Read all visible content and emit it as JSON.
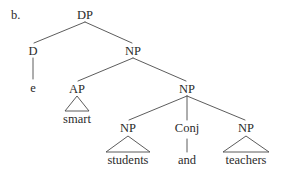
{
  "figure": {
    "item_label": "b.",
    "kind": "syntax-tree",
    "ink_color": "#2b2b2b",
    "line_color": "#4a4a4a",
    "background_color": "#ffffff"
  },
  "nodes": {
    "dp": {
      "label": "DP",
      "x": 85,
      "y": 15
    },
    "d": {
      "label": "D",
      "x": 33,
      "y": 51
    },
    "np_top": {
      "label": "NP",
      "x": 133,
      "y": 51
    },
    "ap": {
      "label": "AP",
      "x": 77,
      "y": 89
    },
    "np_coord": {
      "label": "NP",
      "x": 187,
      "y": 89
    },
    "np_students": {
      "label": "NP",
      "x": 128,
      "y": 128
    },
    "conj": {
      "label": "Conj",
      "x": 187,
      "y": 128
    },
    "np_teachers": {
      "label": "NP",
      "x": 246,
      "y": 128
    }
  },
  "leaves": {
    "e": {
      "label": "e",
      "x": 33,
      "y": 88
    },
    "smart": {
      "label": "smart",
      "x": 77,
      "y": 119
    },
    "students": {
      "label": "students",
      "x": 128,
      "y": 160
    },
    "and": {
      "label": "and",
      "x": 187,
      "y": 160
    },
    "teachers": {
      "label": "teachers",
      "x": 246,
      "y": 160
    }
  },
  "branches": [
    {
      "name": "dp-to-d",
      "x1": 85,
      "y1": 22,
      "x2": 34,
      "y2": 43
    },
    {
      "name": "dp-to-np",
      "x1": 85,
      "y1": 22,
      "x2": 132,
      "y2": 43
    },
    {
      "name": "d-to-e",
      "x1": 33,
      "y1": 58,
      "x2": 33,
      "y2": 79
    },
    {
      "name": "np-to-ap",
      "x1": 133,
      "y1": 58,
      "x2": 78,
      "y2": 81
    },
    {
      "name": "np-to-np-coord",
      "x1": 133,
      "y1": 58,
      "x2": 186,
      "y2": 81
    },
    {
      "name": "np-coord-to-np-students",
      "x1": 187,
      "y1": 96,
      "x2": 129,
      "y2": 120
    },
    {
      "name": "np-coord-to-conj",
      "x1": 187,
      "y1": 96,
      "x2": 187,
      "y2": 120
    },
    {
      "name": "np-coord-to-np-teachers",
      "x1": 187,
      "y1": 96,
      "x2": 245,
      "y2": 120
    },
    {
      "name": "conj-to-and",
      "x1": 187,
      "y1": 139,
      "x2": 187,
      "y2": 152
    }
  ],
  "triangles": [
    {
      "name": "ap-triangle",
      "apex_x": 77,
      "apex_y": 96,
      "left_x": 65,
      "right_x": 89,
      "base_y": 111
    },
    {
      "name": "np-students-triangle",
      "apex_x": 128,
      "apex_y": 136,
      "left_x": 106,
      "right_x": 150,
      "base_y": 152
    },
    {
      "name": "np-teachers-triangle",
      "apex_x": 246,
      "apex_y": 136,
      "left_x": 223,
      "right_x": 269,
      "base_y": 152
    }
  ]
}
